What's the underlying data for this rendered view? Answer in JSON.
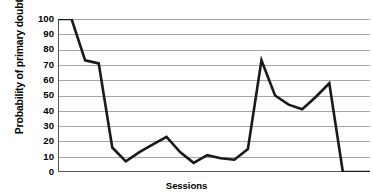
{
  "chart": {
    "title": "will happen to my children",
    "title_note": "first title line cropped above image edge",
    "xlabel": "Sessions",
    "ylabel": "Probability of primary doubt (%)"
  },
  "axis": {
    "yticks": [
      "100",
      "90",
      "80",
      "70",
      "60",
      "50",
      "40",
      "30",
      "20",
      "10",
      "0"
    ]
  },
  "style": {
    "line_color": "#1a1a1a",
    "grid_color": "#a6a6a6",
    "axis_color": "#555555",
    "background": "#ffffff"
  },
  "chart_data": {
    "type": "line",
    "title": "will happen to my children",
    "xlabel": "Sessions",
    "ylabel": "Probability of primary doubt (%)",
    "ylim": [
      0,
      100
    ],
    "ytick_step": 10,
    "grid": true,
    "legend": "none",
    "x": [
      1,
      2,
      3,
      4,
      5,
      6,
      7,
      8,
      9,
      10,
      11,
      12,
      13,
      14,
      15,
      16,
      17,
      18,
      19,
      20,
      21,
      22,
      23,
      24
    ],
    "values": [
      100,
      100,
      73,
      71,
      16,
      7,
      13,
      18,
      23,
      13,
      6,
      11,
      9,
      8,
      15,
      73,
      50,
      44,
      41,
      49,
      58,
      0,
      0,
      0
    ],
    "series": [
      {
        "name": "Probability of primary doubt",
        "values": [
          100,
          100,
          73,
          71,
          16,
          7,
          13,
          18,
          23,
          13,
          6,
          11,
          9,
          8,
          15,
          73,
          50,
          44,
          41,
          49,
          58,
          0,
          0,
          0
        ]
      }
    ]
  }
}
